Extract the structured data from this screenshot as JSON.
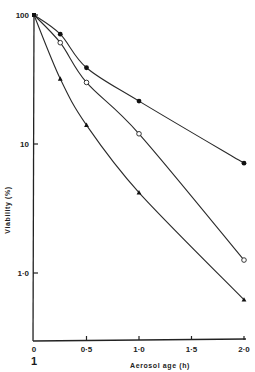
{
  "chart_data": {
    "type": "line",
    "title": "",
    "panel_label": "1",
    "xlabel": "Aerosol age (h)",
    "ylabel": "Viability (%)",
    "xlim": [
      0,
      2.0
    ],
    "ylim": [
      0.5,
      100
    ],
    "yscale": "log",
    "grid": false,
    "legend": null,
    "x_ticks": [
      {
        "value": 0,
        "label": "0"
      },
      {
        "value": 0.5,
        "label": "0·5"
      },
      {
        "value": 1.0,
        "label": "1·0"
      },
      {
        "value": 1.5,
        "label": "1·5"
      },
      {
        "value": 2.0,
        "label": "2·0"
      }
    ],
    "y_ticks": [
      {
        "value": 100,
        "label": "100"
      },
      {
        "value": 10,
        "label": "10"
      },
      {
        "value": 1,
        "label": "1·0"
      }
    ],
    "series": [
      {
        "name": "filled circles",
        "marker": "filled-circle",
        "x": [
          0,
          0.25,
          0.5,
          1.0,
          2.0
        ],
        "values": [
          100,
          71,
          39,
          21.5,
          7.1
        ]
      },
      {
        "name": "open circles",
        "marker": "open-circle",
        "x": [
          0,
          0.25,
          0.5,
          1.0,
          2.0
        ],
        "values": [
          100,
          61,
          30,
          12,
          1.26
        ]
      },
      {
        "name": "filled triangles",
        "marker": "filled-triangle",
        "x": [
          0,
          0.25,
          0.5,
          1.0,
          2.0
        ],
        "values": [
          100,
          32,
          14,
          4.2,
          0.62
        ]
      }
    ]
  }
}
